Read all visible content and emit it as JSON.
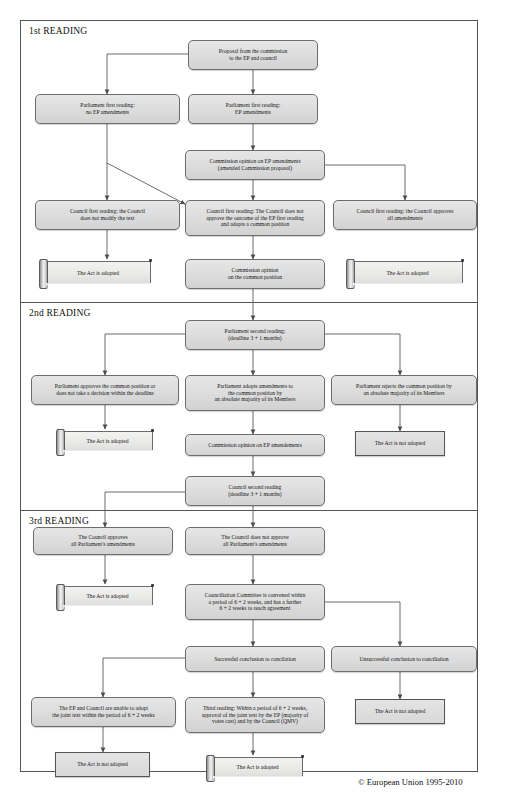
{
  "document": {
    "title": "EU Co-decision procedure flowchart",
    "copyright": "© European Union 1995-2010",
    "frame_border_color": "#555555",
    "box_fill_color": "#dcdcdc",
    "box_border_color": "#6d6d6d",
    "connector_color": "#555555"
  },
  "sections": [
    {
      "id": "reading1",
      "label": "1st READING"
    },
    {
      "id": "reading2",
      "label": "2nd READING"
    },
    {
      "id": "reading3",
      "label": "3rd READING"
    }
  ],
  "nodes": [
    {
      "id": "n1",
      "kind": "process",
      "label": "Proposal from the commission\nto the EP and council"
    },
    {
      "id": "n2",
      "kind": "process",
      "label": "Parliament first reading:\nno EP amendments"
    },
    {
      "id": "n3",
      "kind": "process",
      "label": "Parliament first reading:\nEP amendments"
    },
    {
      "id": "n4",
      "kind": "process",
      "label": "Commission opinion on EP amendments\n(amended Commission proposal)"
    },
    {
      "id": "n5",
      "kind": "process",
      "label": "Council first reading: the Council\ndoes not modify the text"
    },
    {
      "id": "n6",
      "kind": "process",
      "label": "Council first reading: The Council does not\napprove the outcome of the EP first reading\nand adopts a common position"
    },
    {
      "id": "n7",
      "kind": "process",
      "label": "Council first reading: the Council approves\nall amendments"
    },
    {
      "id": "n8",
      "kind": "scroll",
      "label": "The Act is adopted"
    },
    {
      "id": "n9",
      "kind": "process",
      "label": "Commission opinion\non the common position"
    },
    {
      "id": "n10",
      "kind": "scroll",
      "label": "The Act is adopted"
    },
    {
      "id": "n11",
      "kind": "process",
      "label": "Parliament second reading:\n(deadline 3 + 1 months)"
    },
    {
      "id": "n12",
      "kind": "process",
      "label": "Parliament approves the common position or\ndoes not take a decision within the deadline"
    },
    {
      "id": "n13",
      "kind": "process",
      "label": "Parliament adopts amendments to\nthe common position by\nan absolute majority of its Members"
    },
    {
      "id": "n14",
      "kind": "process",
      "label": "Parliament rejects the common position by\nan absolute majority of its Members"
    },
    {
      "id": "n15",
      "kind": "scroll",
      "label": "The Act is adopted"
    },
    {
      "id": "n16",
      "kind": "process",
      "label": "Commission opinion on EP amendements"
    },
    {
      "id": "n17",
      "kind": "square",
      "label": "The Act is not adopted"
    },
    {
      "id": "n18",
      "kind": "process",
      "label": "Council second reading\n(deadline 3 + 1 months)"
    },
    {
      "id": "n19",
      "kind": "process",
      "label": "The Council approves\nall Parliament's amendments"
    },
    {
      "id": "n20",
      "kind": "process",
      "label": "The Council does not approve\nall Parliament's amendments"
    },
    {
      "id": "n21",
      "kind": "scroll",
      "label": "The Act is adopted"
    },
    {
      "id": "n22",
      "kind": "process",
      "label": "Counciliation Committee is convened within\na period of 6 + 2 weeks, and has a further\n6 + 2 weeks to reach agreement"
    },
    {
      "id": "n23",
      "kind": "process",
      "label": "Successful conclusion to concilation"
    },
    {
      "id": "n24",
      "kind": "process",
      "label": "Unsuccessful conclusion to conciliation"
    },
    {
      "id": "n25",
      "kind": "process",
      "label": "The EP and Council are unable to adopt\nthe joint text within the period of 6 + 2 weeks"
    },
    {
      "id": "n26",
      "kind": "process",
      "label": "Third reading: Within a period of  6 + 2 weeks,\napproval of the joint text by the EP (majority of\nvotes cast) and by the Council (QMV)"
    },
    {
      "id": "n27",
      "kind": "square",
      "label": "The Act is not adopted"
    },
    {
      "id": "n28",
      "kind": "square",
      "label": "The Act is not adopted"
    },
    {
      "id": "n29",
      "kind": "scroll",
      "label": "The Act is adopted"
    }
  ]
}
